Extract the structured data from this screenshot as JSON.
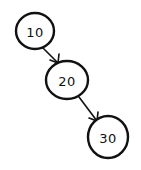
{
  "diagram": {
    "type": "binary-tree",
    "style": "hand-drawn",
    "colors": {
      "stroke": "#111111",
      "background": "#ffffff"
    },
    "nodes": [
      {
        "id": "n10",
        "label": "10",
        "cx": 35,
        "cy": 31,
        "r": 19
      },
      {
        "id": "n20",
        "label": "20",
        "cx": 67,
        "cy": 80,
        "r": 20
      },
      {
        "id": "n30",
        "label": "30",
        "cx": 108,
        "cy": 137,
        "r": 20
      }
    ],
    "edges": [
      {
        "from": "n10",
        "to": "n20",
        "x1": 43,
        "y1": 48,
        "x2": 58,
        "y2": 63
      },
      {
        "from": "n20",
        "to": "n30",
        "x1": 79,
        "y1": 97,
        "x2": 97,
        "y2": 121
      }
    ]
  }
}
